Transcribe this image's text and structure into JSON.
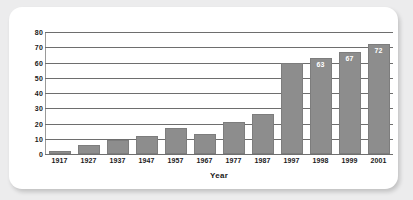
{
  "chart_data": {
    "type": "bar",
    "title": "",
    "subtitle": "",
    "xlabel": "Year",
    "ylabel": "",
    "categories": [
      "1917",
      "1927",
      "1937",
      "1947",
      "1957",
      "1967",
      "1977",
      "1987",
      "1997",
      "1998",
      "1999",
      "2001"
    ],
    "values": [
      2,
      6,
      9,
      12,
      17,
      13,
      21,
      26,
      60,
      63,
      67,
      72
    ],
    "data_labels": [
      "",
      "",
      "",
      "",
      "",
      "",
      "",
      "",
      "",
      "63",
      "67",
      "72"
    ],
    "ylim": [
      0,
      80
    ],
    "ytick_step": 10,
    "yticks": [
      "80",
      "70",
      "60",
      "50",
      "40",
      "30",
      "20",
      "10",
      "0"
    ],
    "ytick_values": [
      80,
      70,
      60,
      50,
      40,
      30,
      20,
      10,
      0
    ],
    "grid": true,
    "grid_orientation": "horizontal",
    "legend": false,
    "legend_position": "none",
    "bar_color": "#8d8d8d",
    "bar_border_color": "#7d7d7d",
    "gridline_color": "#6e6e6e",
    "label_text_color": "#ffffff",
    "axis_text_color": "#1a1a1a",
    "background_color": "#ffffff",
    "page_background_color": "#ececed"
  }
}
